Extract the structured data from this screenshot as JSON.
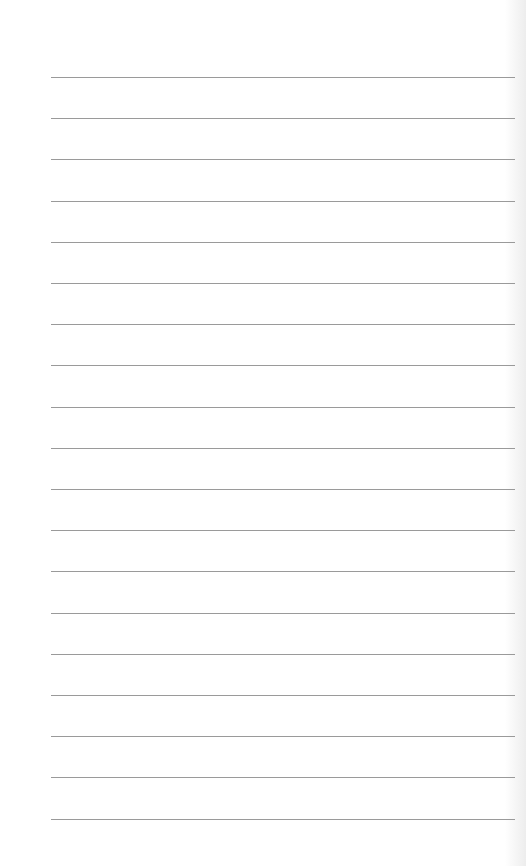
{
  "page": {
    "type": "lined-paper",
    "line_count": 19,
    "first_line_y": 77,
    "line_spacing": 41.2,
    "line_color": "#9a9a9a",
    "background": "#ffffff"
  }
}
